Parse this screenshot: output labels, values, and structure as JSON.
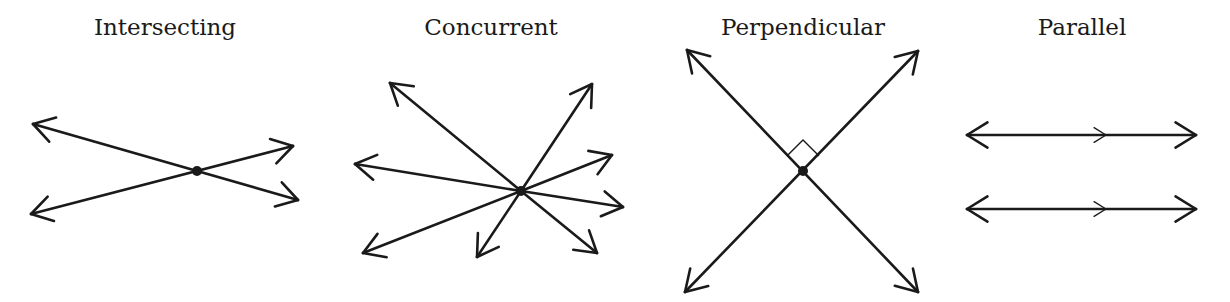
{
  "panels": [
    {
      "title": "Intersecting",
      "center_x": 165
    },
    {
      "title": "Concurrent",
      "center_x": 491
    },
    {
      "title": "Perpendicular",
      "center_x": 803
    },
    {
      "title": "Parallel",
      "center_x": 1082
    }
  ],
  "colors": {
    "ink": "#1a1a1a",
    "background": "#ffffff"
  },
  "figures": {
    "intersecting": {
      "point": [
        197,
        171
      ],
      "lines": [
        {
          "from": [
            33,
            124
          ],
          "to": [
            298,
            200
          ]
        },
        {
          "from": [
            31,
            214
          ],
          "to": [
            293,
            146
          ]
        }
      ]
    },
    "concurrent": {
      "point": [
        521,
        191
      ],
      "rays_to": [
        [
          390,
          83
        ],
        [
          592,
          84
        ],
        [
          612,
          155
        ],
        [
          623,
          207
        ],
        [
          597,
          253
        ],
        [
          477,
          257
        ],
        [
          363,
          253
        ],
        [
          355,
          164
        ]
      ]
    },
    "perpendicular": {
      "point": [
        803,
        171
      ],
      "lines": [
        {
          "from": [
            687,
            50
          ],
          "to": [
            918,
            292
          ]
        },
        {
          "from": [
            685,
            292
          ],
          "to": [
            918,
            51
          ]
        }
      ],
      "right_angle_marker": true
    },
    "parallel": {
      "lines": [
        {
          "y": 135,
          "x1": 967,
          "x2": 1196,
          "tick_x": 1106
        },
        {
          "y": 209,
          "x1": 967,
          "x2": 1196,
          "tick_x": 1106
        }
      ]
    }
  }
}
